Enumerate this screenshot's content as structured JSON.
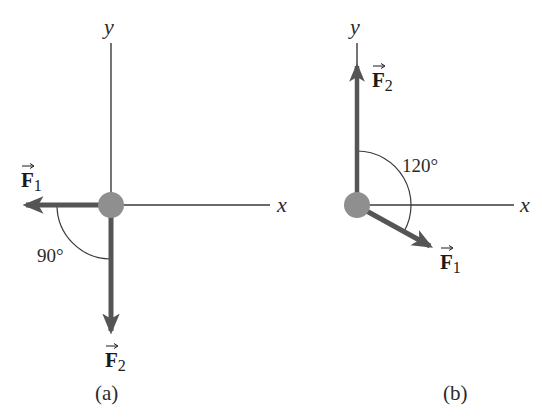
{
  "figure": {
    "panels": [
      {
        "id": "a",
        "caption": "(a)",
        "axes": {
          "x_label": "x",
          "y_label": "y"
        },
        "vectors": [
          {
            "name": "F",
            "subscript": "1",
            "direction": "negative x (left)"
          },
          {
            "name": "F",
            "subscript": "2",
            "direction": "negative y (down)"
          }
        ],
        "angle": {
          "label": "90°",
          "between": [
            "F1",
            "F2"
          ]
        }
      },
      {
        "id": "b",
        "caption": "(b)",
        "axes": {
          "x_label": "x",
          "y_label": "y"
        },
        "vectors": [
          {
            "name": "F",
            "subscript": "1",
            "direction": "30° below positive x"
          },
          {
            "name": "F",
            "subscript": "2",
            "direction": "positive y (up)"
          }
        ],
        "angle": {
          "label": "120°",
          "between": [
            "F2",
            "F1"
          ]
        }
      }
    ],
    "colors": {
      "axis": "#3a3a3a",
      "vector": "#555555",
      "particle": "#8f8f8f",
      "arc": "#3a3a3a",
      "text": "#2b2b2b"
    }
  }
}
